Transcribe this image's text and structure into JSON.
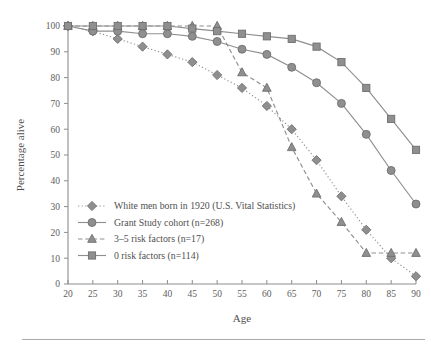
{
  "figure": {
    "background_color": "#ffffff",
    "rule_color": "#a9a9a9"
  },
  "axes": {
    "x_title": "Age",
    "y_title": "Percentage alive",
    "x_ticks": [
      "20",
      "25",
      "30",
      "35",
      "40",
      "45",
      "50",
      "55",
      "60",
      "65",
      "70",
      "75",
      "80",
      "85",
      "90"
    ],
    "y_ticks": [
      "0",
      "10",
      "20",
      "30",
      "40",
      "50",
      "60",
      "70",
      "80",
      "90",
      "100"
    ],
    "axis_color": "#8d8d8d",
    "tick_label_color": "#5d5d5d"
  },
  "legend": {
    "position": "inside-lower-left",
    "entries": [
      {
        "label": "White men born in 1920 (U.S. Vital Statistics)",
        "marker": "diamond",
        "line_style": "dotted",
        "color": "#8f8f8f"
      },
      {
        "label": "Grant Study cohort (n=268)",
        "marker": "circle",
        "line_style": "solid",
        "color": "#8f8f8f"
      },
      {
        "label": "3–5 risk factors (n=17)",
        "marker": "triangle",
        "line_style": "dashed",
        "color": "#8f8f8f"
      },
      {
        "label": "0 risk factors (n=114)",
        "marker": "square",
        "line_style": "solid",
        "color": "#8f8f8f"
      }
    ]
  },
  "chart_data": {
    "type": "line",
    "title": "",
    "xlabel": "Age",
    "ylabel": "Percentage alive",
    "xlim": [
      20,
      90
    ],
    "ylim": [
      0,
      100
    ],
    "grid": false,
    "legend_position": "inside-lower-left",
    "x": [
      20,
      25,
      30,
      35,
      40,
      45,
      50,
      55,
      60,
      65,
      70,
      75,
      80,
      85,
      90
    ],
    "series": [
      {
        "name": "White men born in 1920 (U.S. Vital Statistics)",
        "marker": "diamond",
        "line_style": "dotted",
        "color": "#8f8f8f",
        "values": [
          100,
          98,
          95,
          92,
          89,
          86,
          81,
          76,
          69,
          60,
          48,
          34,
          21,
          10,
          3
        ]
      },
      {
        "name": "Grant Study cohort (n=268)",
        "marker": "circle",
        "line_style": "solid",
        "color": "#8f8f8f",
        "values": [
          100,
          98,
          98,
          97,
          97,
          96,
          94,
          91,
          89,
          84,
          78,
          70,
          58,
          44,
          31
        ]
      },
      {
        "name": "3–5 risk factors (n=17)",
        "marker": "triangle",
        "line_style": "dashed",
        "color": "#8f8f8f",
        "values": [
          100,
          100,
          100,
          100,
          100,
          100,
          100,
          82,
          76,
          53,
          35,
          24,
          12,
          12,
          12
        ]
      },
      {
        "name": "0 risk factors (n=114)",
        "marker": "square",
        "line_style": "solid",
        "color": "#8f8f8f",
        "values": [
          100,
          100,
          100,
          100,
          100,
          99,
          98,
          97,
          96,
          95,
          92,
          86,
          76,
          64,
          52
        ]
      }
    ]
  }
}
